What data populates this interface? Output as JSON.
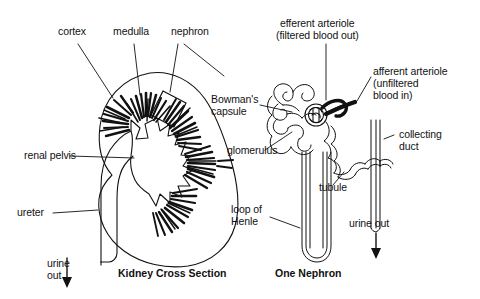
{
  "figure": {
    "type": "anatomical-diagram",
    "background_color": "#ffffff",
    "line_color": "#111111",
    "text_color": "#111111"
  },
  "panels": [
    {
      "id": "kidney-cross-section",
      "caption": "Kidney Cross Section"
    },
    {
      "id": "one-nephron",
      "caption": "One Nephron"
    }
  ],
  "labels": {
    "cortex": "cortex",
    "medulla": "medulla",
    "nephron": "nephron",
    "renal_pelvis": "renal pelvis",
    "ureter": "ureter",
    "urine_out_left_line1": "urine",
    "urine_out_left_line2": "out",
    "efferent_line1": "efferent arteriole",
    "efferent_line2": "(filtered blood out)",
    "afferent_line1": "afferent arteriole",
    "afferent_line2": "(unfiltered",
    "afferent_line3": "blood in)",
    "bowmans_line1": "Bowman's",
    "bowmans_line2": "capsule",
    "glomerulus": "glomerulus",
    "collecting_line1": "collecting",
    "collecting_line2": "duct",
    "tubule": "tubule",
    "loop_line1": "loop of",
    "loop_line2": "Henle",
    "urine_out_right": "urine out"
  },
  "captions": {
    "left": "Kidney Cross Section",
    "right": "One Nephron"
  }
}
